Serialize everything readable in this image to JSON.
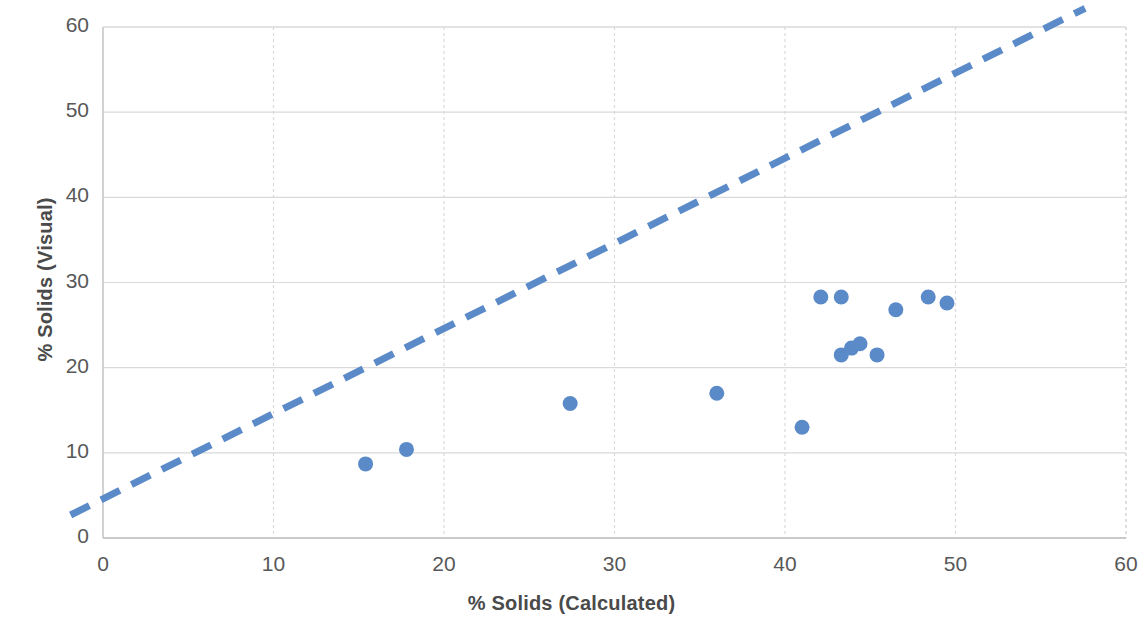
{
  "chart_data": {
    "type": "scatter",
    "title": "",
    "xlabel": "% Solids (Calculated)",
    "ylabel": "% Solids (Visual)",
    "xlim": [
      0,
      60
    ],
    "ylim": [
      0,
      60
    ],
    "xticks": [
      0,
      10,
      20,
      30,
      40,
      50,
      60
    ],
    "yticks": [
      0,
      10,
      20,
      30,
      40,
      50,
      60
    ],
    "xtick_labels": [
      "0",
      "10",
      "20",
      "30",
      "40",
      "50",
      "60"
    ],
    "ytick_labels": [
      "0",
      "10",
      "20",
      "30",
      "40",
      "50",
      "60"
    ],
    "grid": true,
    "grid_color": "#d9d9d9",
    "legend": null,
    "marker_color": "#5b8ac9",
    "marker_size": 15,
    "series": [
      {
        "name": "Samples",
        "type": "scatter",
        "color": "#5b8ac9",
        "points": [
          {
            "x": 15.4,
            "y": 8.7
          },
          {
            "x": 17.8,
            "y": 10.4
          },
          {
            "x": 27.4,
            "y": 15.8
          },
          {
            "x": 36.0,
            "y": 17.0
          },
          {
            "x": 41.0,
            "y": 13.0
          },
          {
            "x": 42.1,
            "y": 28.3
          },
          {
            "x": 43.3,
            "y": 28.3
          },
          {
            "x": 43.3,
            "y": 21.5
          },
          {
            "x": 43.9,
            "y": 22.3
          },
          {
            "x": 44.4,
            "y": 22.8
          },
          {
            "x": 45.4,
            "y": 21.5
          },
          {
            "x": 46.5,
            "y": 26.8
          },
          {
            "x": 48.4,
            "y": 28.3
          },
          {
            "x": 49.5,
            "y": 27.6
          }
        ]
      },
      {
        "name": "Reference line",
        "type": "line",
        "style": "dashed",
        "color": "#5b8ac9",
        "width": 7,
        "x_start": -1.9,
        "y_start": 2.7,
        "x_end": 57.6,
        "y_end": 62.2
      }
    ]
  }
}
